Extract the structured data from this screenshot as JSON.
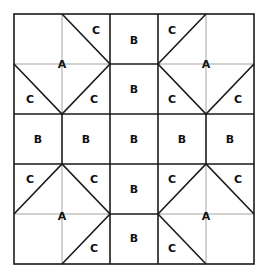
{
  "diagram": {
    "colors": {
      "line": "#1a1a1a",
      "guide": "#9a9a9a",
      "background": "#ffffff",
      "text": "#111111"
    },
    "grid": {
      "x": [
        14,
        62,
        110,
        158,
        206,
        254
      ],
      "y": [
        14,
        64,
        114,
        164,
        214,
        264
      ]
    },
    "labels": [
      {
        "text": "C",
        "x": 96,
        "y": 30
      },
      {
        "text": "B",
        "x": 134,
        "y": 40
      },
      {
        "text": "C",
        "x": 172,
        "y": 30
      },
      {
        "text": "A",
        "x": 62,
        "y": 64
      },
      {
        "text": "A",
        "x": 206,
        "y": 64
      },
      {
        "text": "C",
        "x": 30,
        "y": 99
      },
      {
        "text": "C",
        "x": 94,
        "y": 99
      },
      {
        "text": "B",
        "x": 134,
        "y": 89
      },
      {
        "text": "C",
        "x": 172,
        "y": 99
      },
      {
        "text": "C",
        "x": 238,
        "y": 99
      },
      {
        "text": "B",
        "x": 38,
        "y": 139
      },
      {
        "text": "B",
        "x": 86,
        "y": 139
      },
      {
        "text": "B",
        "x": 134,
        "y": 139
      },
      {
        "text": "B",
        "x": 182,
        "y": 139
      },
      {
        "text": "B",
        "x": 230,
        "y": 139
      },
      {
        "text": "C",
        "x": 30,
        "y": 179
      },
      {
        "text": "C",
        "x": 94,
        "y": 179
      },
      {
        "text": "B",
        "x": 134,
        "y": 189
      },
      {
        "text": "C",
        "x": 172,
        "y": 179
      },
      {
        "text": "C",
        "x": 238,
        "y": 179
      },
      {
        "text": "A",
        "x": 62,
        "y": 216
      },
      {
        "text": "A",
        "x": 206,
        "y": 216
      },
      {
        "text": "C",
        "x": 94,
        "y": 248
      },
      {
        "text": "B",
        "x": 134,
        "y": 238
      },
      {
        "text": "C",
        "x": 172,
        "y": 248
      }
    ]
  }
}
